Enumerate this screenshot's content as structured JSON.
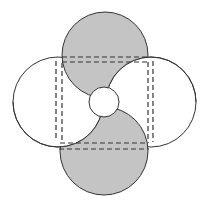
{
  "diagram": {
    "colors": {
      "background": "#ffffff",
      "gray_fill": "#c4c4c4",
      "white_fill": "#ffffff",
      "stroke": "#333333"
    },
    "shapes": {
      "top_gray_circle": {
        "cx": 105,
        "cy": 55,
        "r": 43
      },
      "bottom_gray_circle": {
        "cx": 104,
        "cy": 151,
        "r": 44
      },
      "left_white_circle": {
        "cx": 58,
        "cy": 102,
        "r": 45
      },
      "right_white_circle": {
        "cx": 151,
        "cy": 102,
        "r": 45
      },
      "center_circle": {
        "cx": 104,
        "cy": 102,
        "r": 15
      }
    },
    "dashed_lines": {
      "top": [
        {
          "x1": 62,
          "y1": 57,
          "x2": 148,
          "y2": 57
        },
        {
          "x1": 62,
          "y1": 62,
          "x2": 148,
          "y2": 62
        }
      ],
      "bottom": [
        {
          "x1": 60,
          "y1": 143,
          "x2": 148,
          "y2": 143
        },
        {
          "x1": 59,
          "y1": 149,
          "x2": 149,
          "y2": 149
        }
      ],
      "left": [
        {
          "x1": 56,
          "y1": 61,
          "x2": 56,
          "y2": 141
        },
        {
          "x1": 62,
          "y1": 63,
          "x2": 62,
          "y2": 142
        }
      ],
      "right": [
        {
          "x1": 148,
          "y1": 62,
          "x2": 148,
          "y2": 143
        },
        {
          "x1": 153,
          "y1": 61,
          "x2": 153,
          "y2": 142
        }
      ]
    }
  }
}
